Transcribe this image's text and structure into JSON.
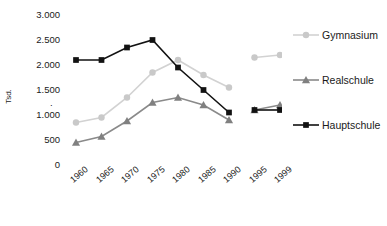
{
  "chart_data": {
    "type": "line",
    "title": "",
    "xlabel": "",
    "ylabel": "Tsd.",
    "categories": [
      "1960",
      "1965",
      "1970",
      "1975",
      "1980",
      "1985",
      "1990",
      "1995",
      "1999"
    ],
    "ylim": [
      0,
      3000
    ],
    "ytick_labels": [
      "3.000",
      "2.500",
      "2.000",
      "1.500",
      "1.000",
      "500",
      "0"
    ],
    "ytick_values": [
      3000,
      2500,
      2000,
      1500,
      1000,
      500,
      0
    ],
    "grid": false,
    "legend_position": "right",
    "axis_break_after_category": "1990",
    "series": [
      {
        "name": "Gymnasium",
        "marker": "circle",
        "color": "#c9c9c9",
        "line_color": "#d2d2d2",
        "values": [
          850,
          950,
          1350,
          1850,
          2100,
          1800,
          1550,
          2150,
          2200
        ]
      },
      {
        "name": "Realschule",
        "marker": "triangle",
        "color": "#808080",
        "line_color": "#8a8a8a",
        "values": [
          450,
          570,
          880,
          1250,
          1350,
          1200,
          900,
          1100,
          1200
        ]
      },
      {
        "name": "Hauptschule",
        "marker": "square",
        "color": "#121212",
        "line_color": "#121212",
        "values": [
          2100,
          2100,
          2350,
          2500,
          1950,
          1500,
          1050,
          1100,
          1100
        ]
      }
    ]
  },
  "legend": {
    "items": [
      {
        "label": "Gymnasium"
      },
      {
        "label": "Realschule"
      },
      {
        "label": "Hauptschule"
      }
    ]
  },
  "axis": {
    "y_title": "Tsd.",
    "y_sub_marker": "."
  }
}
